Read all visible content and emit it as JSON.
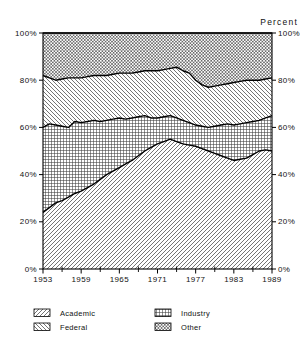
{
  "page": {
    "background": "#ffffff"
  },
  "chart": {
    "percent_label": "Percent",
    "colors": {
      "line": "#000000",
      "hatch": "#3a3a3a",
      "background": "#ffffff"
    },
    "legend": {
      "items": [
        {
          "label": "Academic",
          "pattern": "diagonal-up"
        },
        {
          "label": "Federal",
          "pattern": "diagonal-down"
        },
        {
          "label": "Industry",
          "pattern": "grid"
        },
        {
          "label": "Other",
          "pattern": "crosshatch"
        }
      ]
    }
  },
  "chart_data": {
    "type": "area",
    "stacked": true,
    "title": "",
    "xlabel": "",
    "ylabel": "Percent",
    "xlim": [
      1953,
      1989
    ],
    "ylim": [
      0,
      100
    ],
    "grid": false,
    "legend_position": "bottom",
    "y_tick_labels_left": [
      "0%",
      "20%",
      "40%",
      "60%",
      "80%",
      "100%"
    ],
    "y_tick_labels_right": [
      "0%",
      "20%",
      "40%",
      "60%",
      "80%",
      "100%"
    ],
    "y_tick_values": [
      0,
      20,
      40,
      60,
      80,
      100
    ],
    "x_tick_years": [
      1953,
      1959,
      1965,
      1971,
      1977,
      1983,
      1989
    ],
    "x_minor_years": [
      1956,
      1962,
      1968,
      1974,
      1980,
      1986
    ],
    "x": [
      1953,
      1954,
      1955,
      1956,
      1957,
      1958,
      1959,
      1960,
      1961,
      1962,
      1963,
      1964,
      1965,
      1966,
      1967,
      1968,
      1969,
      1970,
      1971,
      1972,
      1973,
      1974,
      1975,
      1976,
      1977,
      1978,
      1979,
      1980,
      1981,
      1982,
      1983,
      1984,
      1985,
      1986,
      1987,
      1988,
      1989
    ],
    "series": [
      {
        "name": "Academic",
        "pattern": "diagonal-up",
        "values": [
          24,
          26,
          28,
          29,
          30.5,
          32,
          33,
          34.5,
          36,
          38,
          40,
          41.5,
          43,
          44.5,
          46,
          48,
          50,
          51.5,
          53,
          54,
          55,
          54,
          53,
          52.5,
          52,
          51,
          50,
          49,
          48,
          47,
          46,
          46.5,
          47,
          48.5,
          50,
          50.5,
          50
        ]
      },
      {
        "name": "Industry",
        "pattern": "grid",
        "values": [
          36,
          35.5,
          33,
          31.5,
          29.5,
          30.5,
          29,
          28,
          27,
          24.5,
          23,
          22,
          21,
          19,
          18,
          16.5,
          15,
          12.5,
          11,
          10.5,
          10,
          10,
          10,
          9.5,
          9,
          9.5,
          10,
          11.5,
          13,
          14.5,
          15,
          15,
          15,
          14,
          13,
          13.5,
          15
        ]
      },
      {
        "name": "Federal",
        "pattern": "diagonal-down",
        "values": [
          22,
          19.5,
          19,
          20,
          21,
          18.5,
          19,
          19,
          19,
          19.5,
          19,
          19,
          19,
          19.5,
          19,
          19,
          19,
          20,
          20,
          20,
          20,
          21.5,
          21,
          21,
          19,
          17.5,
          17,
          17,
          17,
          17,
          18,
          18,
          18,
          17.5,
          17,
          16.5,
          16
        ]
      },
      {
        "name": "Other",
        "pattern": "crosshatch",
        "values": [
          18,
          19,
          20,
          19.5,
          19,
          19,
          19,
          18.5,
          18,
          18,
          18,
          17.5,
          17,
          17,
          17,
          16.5,
          16,
          16,
          16,
          15.5,
          15,
          14.5,
          16,
          17,
          20,
          22,
          23,
          22.5,
          22,
          21.5,
          21,
          20.5,
          20,
          20,
          20,
          19.5,
          19
        ]
      }
    ]
  }
}
